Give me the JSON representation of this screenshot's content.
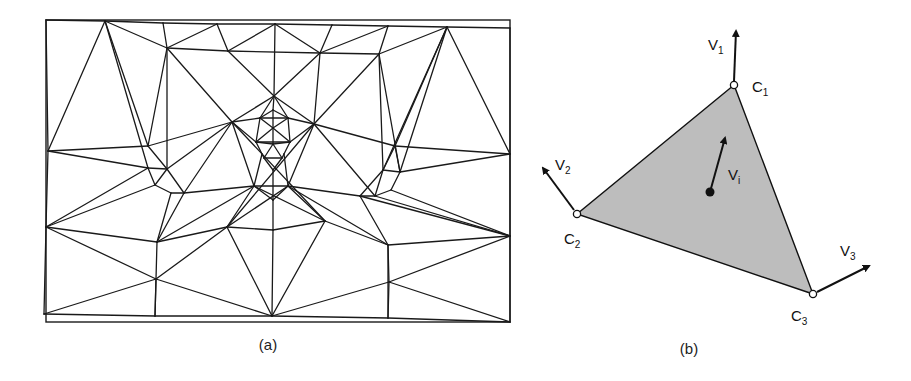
{
  "figure": {
    "panel_a": {
      "caption": "(a)",
      "description": "Triangulated mesh overlaid on rectangular frame (face mesh)",
      "frame": {
        "x1": 46,
        "y1": 20,
        "x2": 510,
        "y2": 322
      },
      "nodes": {
        "A": [
          46,
          20
        ],
        "B": [
          105,
          21
        ],
        "C": [
          163,
          23
        ],
        "D": [
          217,
          24
        ],
        "E": [
          275,
          24
        ],
        "F": [
          332,
          25
        ],
        "G": [
          388,
          26
        ],
        "H": [
          447,
          27
        ],
        "I": [
          510,
          28
        ],
        "J": [
          167,
          48
        ],
        "K": [
          228,
          51
        ],
        "L": [
          320,
          53
        ],
        "M": [
          379,
          54
        ],
        "N": [
          274,
          96
        ],
        "O": [
          48,
          151
        ],
        "P": [
          148,
          146
        ],
        "Q": [
          232,
          122
        ],
        "R": [
          314,
          124
        ],
        "S": [
          395,
          146
        ],
        "T": [
          510,
          154
        ],
        "U": [
          148,
          168
        ],
        "V": [
          167,
          169
        ],
        "W": [
          383,
          170
        ],
        "X": [
          400,
          172
        ],
        "Y": [
          155,
          185
        ],
        "Z": [
          171,
          193
        ],
        "AA": [
          184,
          193
        ],
        "AB": [
          254,
          186
        ],
        "AC": [
          288,
          186
        ],
        "AD": [
          360,
          196
        ],
        "AE": [
          375,
          196
        ],
        "AF": [
          391,
          190
        ],
        "AG": [
          273,
          200
        ],
        "AH": [
          46,
          227
        ],
        "AI": [
          157,
          242
        ],
        "AJ": [
          227,
          227
        ],
        "AK": [
          273,
          230
        ],
        "AL": [
          325,
          221
        ],
        "AM": [
          388,
          245
        ],
        "AN": [
          510,
          236
        ],
        "AO": [
          156,
          279
        ],
        "AP": [
          272,
          316
        ],
        "AQ": [
          389,
          282
        ],
        "AR": [
          44,
          314
        ],
        "AS": [
          155,
          316
        ],
        "AT": [
          388,
          318
        ],
        "AU": [
          510,
          322
        ],
        "FA": [
          260,
          118
        ],
        "FB": [
          288,
          118
        ],
        "FC": [
          256,
          142
        ],
        "FD": [
          290,
          142
        ],
        "FE": [
          273,
          110
        ],
        "FF": [
          273,
          128
        ],
        "FG": [
          273,
          144
        ],
        "FH": [
          264,
          158
        ],
        "FI": [
          282,
          158
        ],
        "FJ": [
          273,
          170
        ],
        "FK": [
          262,
          154
        ],
        "FL": [
          284,
          154
        ]
      },
      "edges": [
        [
          "A",
          "B"
        ],
        [
          "B",
          "C"
        ],
        [
          "C",
          "D"
        ],
        [
          "D",
          "E"
        ],
        [
          "E",
          "F"
        ],
        [
          "F",
          "G"
        ],
        [
          "G",
          "H"
        ],
        [
          "H",
          "I"
        ],
        [
          "A",
          "O"
        ],
        [
          "O",
          "AH"
        ],
        [
          "AH",
          "AR"
        ],
        [
          "I",
          "T"
        ],
        [
          "T",
          "AN"
        ],
        [
          "AN",
          "AU"
        ],
        [
          "AR",
          "AS"
        ],
        [
          "AS",
          "AP"
        ],
        [
          "AP",
          "AT"
        ],
        [
          "AT",
          "AU"
        ],
        [
          "B",
          "O"
        ],
        [
          "B",
          "J"
        ],
        [
          "B",
          "P"
        ],
        [
          "B",
          "U"
        ],
        [
          "C",
          "J"
        ],
        [
          "D",
          "J"
        ],
        [
          "D",
          "K"
        ],
        [
          "E",
          "K"
        ],
        [
          "E",
          "L"
        ],
        [
          "E",
          "N"
        ],
        [
          "F",
          "L"
        ],
        [
          "G",
          "L"
        ],
        [
          "G",
          "M"
        ],
        [
          "H",
          "M"
        ],
        [
          "H",
          "S"
        ],
        [
          "H",
          "X"
        ],
        [
          "H",
          "T"
        ],
        [
          "H",
          "W"
        ],
        [
          "J",
          "K"
        ],
        [
          "K",
          "L"
        ],
        [
          "L",
          "M"
        ],
        [
          "J",
          "Q"
        ],
        [
          "J",
          "V"
        ],
        [
          "J",
          "P"
        ],
        [
          "K",
          "N"
        ],
        [
          "N",
          "L"
        ],
        [
          "L",
          "R"
        ],
        [
          "M",
          "R"
        ],
        [
          "M",
          "X"
        ],
        [
          "M",
          "W"
        ],
        [
          "N",
          "Q"
        ],
        [
          "N",
          "R"
        ],
        [
          "N",
          "FE"
        ],
        [
          "O",
          "P"
        ],
        [
          "O",
          "U"
        ],
        [
          "P",
          "Q"
        ],
        [
          "P",
          "V"
        ],
        [
          "U",
          "V"
        ],
        [
          "U",
          "Y"
        ],
        [
          "V",
          "Y"
        ],
        [
          "Y",
          "Z"
        ],
        [
          "Z",
          "AA"
        ],
        [
          "V",
          "AA"
        ],
        [
          "Y",
          "AH"
        ],
        [
          "U",
          "AH"
        ],
        [
          "Q",
          "FA"
        ],
        [
          "Q",
          "FC"
        ],
        [
          "Q",
          "AA"
        ],
        [
          "Q",
          "AB"
        ],
        [
          "Q",
          "V"
        ],
        [
          "Q",
          "AL"
        ],
        [
          "R",
          "FB"
        ],
        [
          "R",
          "FD"
        ],
        [
          "R",
          "AE"
        ],
        [
          "R",
          "AC"
        ],
        [
          "R",
          "S"
        ],
        [
          "R",
          "AJ"
        ],
        [
          "S",
          "T"
        ],
        [
          "S",
          "W"
        ],
        [
          "S",
          "X"
        ],
        [
          "W",
          "X"
        ],
        [
          "W",
          "AE"
        ],
        [
          "X",
          "T"
        ],
        [
          "X",
          "AF"
        ],
        [
          "AF",
          "AE"
        ],
        [
          "AE",
          "AD"
        ],
        [
          "AF",
          "AN"
        ],
        [
          "W",
          "AD"
        ],
        [
          "AA",
          "AB"
        ],
        [
          "AB",
          "AC"
        ],
        [
          "AC",
          "AD"
        ],
        [
          "AB",
          "AG"
        ],
        [
          "AC",
          "AG"
        ],
        [
          "AB",
          "AJ"
        ],
        [
          "AC",
          "AL"
        ],
        [
          "AH",
          "AI"
        ],
        [
          "AH",
          "AO"
        ],
        [
          "AI",
          "AJ"
        ],
        [
          "AJ",
          "AK"
        ],
        [
          "AK",
          "AL"
        ],
        [
          "AL",
          "AM"
        ],
        [
          "AM",
          "AN"
        ],
        [
          "AI",
          "Z"
        ],
        [
          "AI",
          "AA"
        ],
        [
          "AI",
          "AB"
        ],
        [
          "AI",
          "AS"
        ],
        [
          "AG",
          "AK"
        ],
        [
          "AK",
          "AP"
        ],
        [
          "AJ",
          "AP"
        ],
        [
          "AL",
          "AP"
        ],
        [
          "AM",
          "AD"
        ],
        [
          "AM",
          "AC"
        ],
        [
          "AM",
          "AQ"
        ],
        [
          "AM",
          "AT"
        ],
        [
          "AJ",
          "AO"
        ],
        [
          "AO",
          "AP"
        ],
        [
          "AO",
          "AR"
        ],
        [
          "AO",
          "AS"
        ],
        [
          "AQ",
          "AP"
        ],
        [
          "AQ",
          "AN"
        ],
        [
          "AQ",
          "AU"
        ],
        [
          "AQ",
          "AT"
        ],
        [
          "AJ",
          "AC"
        ],
        [
          "AL",
          "AB"
        ],
        [
          "AD",
          "AN"
        ],
        [
          "AE",
          "AN"
        ],
        [
          "FE",
          "FA"
        ],
        [
          "FE",
          "FB"
        ],
        [
          "FA",
          "FC"
        ],
        [
          "FB",
          "FD"
        ],
        [
          "FA",
          "FF"
        ],
        [
          "FB",
          "FF"
        ],
        [
          "FE",
          "FF"
        ],
        [
          "FF",
          "FG"
        ],
        [
          "FC",
          "FG"
        ],
        [
          "FD",
          "FG"
        ],
        [
          "FC",
          "FK"
        ],
        [
          "FD",
          "FL"
        ],
        [
          "FK",
          "FH"
        ],
        [
          "FL",
          "FI"
        ],
        [
          "FG",
          "FH"
        ],
        [
          "FG",
          "FI"
        ],
        [
          "FH",
          "FJ"
        ],
        [
          "FI",
          "FJ"
        ],
        [
          "FJ",
          "AG"
        ],
        [
          "FK",
          "AB"
        ],
        [
          "FL",
          "AC"
        ],
        [
          "FA",
          "FB"
        ],
        [
          "FC",
          "FD"
        ],
        [
          "FH",
          "FI"
        ],
        [
          "FF",
          "FC"
        ],
        [
          "FF",
          "FD"
        ],
        [
          "N",
          "FA"
        ],
        [
          "N",
          "FB"
        ]
      ]
    },
    "panel_b": {
      "caption": "(b)",
      "description": "Shaded triangle with vertex control points C1, C2, C3, vertex vectors V1, V2, V3, and interior vector Vi",
      "triangle_fill": "#bdbdbd",
      "vertices": [
        {
          "name": "C",
          "sub": "1",
          "x": 734,
          "y": 85,
          "label_x": 752,
          "label_y": 92
        },
        {
          "name": "C",
          "sub": "2",
          "x": 577,
          "y": 214,
          "label_x": 564,
          "label_y": 244
        },
        {
          "name": "C",
          "sub": "3",
          "x": 813,
          "y": 294,
          "label_x": 791,
          "label_y": 321
        }
      ],
      "vectors": [
        {
          "name": "V",
          "sub": "1",
          "from": [
            734,
            81
          ],
          "to": [
            736,
            31
          ],
          "label_x": 708,
          "label_y": 50
        },
        {
          "name": "V",
          "sub": "2",
          "from": [
            574,
            210
          ],
          "to": [
            543,
            168
          ],
          "label_x": 555,
          "label_y": 170
        },
        {
          "name": "V",
          "sub": "3",
          "from": [
            817,
            292
          ],
          "to": [
            869,
            266
          ],
          "label_x": 840,
          "label_y": 256
        },
        {
          "name": "V",
          "sub": "i",
          "from": [
            710,
            192
          ],
          "to": [
            725,
            138
          ],
          "label_x": 728,
          "label_y": 180
        }
      ],
      "interior_point": {
        "x": 710,
        "y": 192
      }
    }
  }
}
